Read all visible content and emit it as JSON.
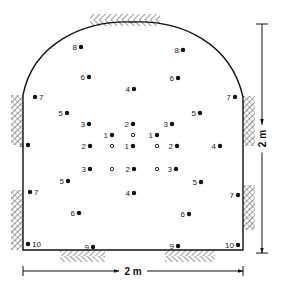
{
  "diagram": {
    "title": "",
    "colors": {
      "ink": "#111111",
      "background": "#ffffff",
      "hatch": "#222222"
    },
    "profile": {
      "left_wall_x": 23,
      "right_wall_x": 243,
      "floor_y": 250,
      "left_spring_y": 95,
      "right_spring_y": 97,
      "crown_y": 22,
      "crown_x": 133
    },
    "dimensions": {
      "width": {
        "label": "2 m",
        "x1": 23,
        "x2": 243,
        "y": 271
      },
      "height": {
        "label": "2 m",
        "x": 262,
        "y1": 24,
        "y2": 253
      }
    },
    "legend": {
      "filled_circle": "charged hole (number = firing sequence)",
      "open_circle": "empty relief hole"
    },
    "holes": [
      {
        "n": "8",
        "x": 81,
        "y": 47,
        "type": "charged",
        "label_side": "left"
      },
      {
        "n": "8",
        "x": 183,
        "y": 50,
        "type": "charged",
        "label_side": "left"
      },
      {
        "n": "6",
        "x": 89,
        "y": 77,
        "type": "charged",
        "label_side": "left"
      },
      {
        "n": "6",
        "x": 178,
        "y": 78,
        "type": "charged",
        "label_side": "left"
      },
      {
        "n": "4",
        "x": 134,
        "y": 89,
        "type": "charged",
        "label_side": "left"
      },
      {
        "n": "7",
        "x": 35,
        "y": 97,
        "type": "charged",
        "label_side": "right"
      },
      {
        "n": "7",
        "x": 235,
        "y": 97,
        "type": "charged",
        "label_side": "left"
      },
      {
        "n": "5",
        "x": 67,
        "y": 113,
        "type": "charged",
        "label_side": "left"
      },
      {
        "n": "5",
        "x": 200,
        "y": 113,
        "type": "charged",
        "label_side": "left"
      },
      {
        "n": "3",
        "x": 89,
        "y": 124,
        "type": "charged",
        "label_side": "left"
      },
      {
        "n": "2",
        "x": 133,
        "y": 124,
        "type": "charged",
        "label_side": "left"
      },
      {
        "n": "3",
        "x": 172,
        "y": 124,
        "type": "charged",
        "label_side": "left"
      },
      {
        "n": "1",
        "x": 112,
        "y": 135,
        "type": "charged",
        "label_side": "left"
      },
      {
        "n": "",
        "x": 133,
        "y": 135,
        "type": "empty",
        "label_side": "none"
      },
      {
        "n": "1",
        "x": 157,
        "y": 135,
        "type": "charged",
        "label_side": "left"
      },
      {
        "n": "4",
        "x": 28,
        "y": 145,
        "type": "charged",
        "label_side": "left"
      },
      {
        "n": "2",
        "x": 90,
        "y": 146,
        "type": "charged",
        "label_side": "left"
      },
      {
        "n": "",
        "x": 112,
        "y": 146,
        "type": "empty",
        "label_side": "none"
      },
      {
        "n": "1",
        "x": 133,
        "y": 146,
        "type": "charged",
        "label_side": "left"
      },
      {
        "n": "",
        "x": 157,
        "y": 146,
        "type": "empty",
        "label_side": "none"
      },
      {
        "n": "2",
        "x": 177,
        "y": 146,
        "type": "charged",
        "label_side": "left"
      },
      {
        "n": "4",
        "x": 220,
        "y": 146,
        "type": "charged",
        "label_side": "left"
      },
      {
        "n": "3",
        "x": 90,
        "y": 169,
        "type": "charged",
        "label_side": "left"
      },
      {
        "n": "",
        "x": 112,
        "y": 169,
        "type": "empty",
        "label_side": "none"
      },
      {
        "n": "2",
        "x": 134,
        "y": 169,
        "type": "charged",
        "label_side": "left"
      },
      {
        "n": "",
        "x": 157,
        "y": 169,
        "type": "empty",
        "label_side": "none"
      },
      {
        "n": "3",
        "x": 176,
        "y": 169,
        "type": "charged",
        "label_side": "left"
      },
      {
        "n": "5",
        "x": 68,
        "y": 181,
        "type": "charged",
        "label_side": "left"
      },
      {
        "n": "5",
        "x": 201,
        "y": 182,
        "type": "charged",
        "label_side": "left"
      },
      {
        "n": "7",
        "x": 30,
        "y": 192,
        "type": "charged",
        "label_side": "right"
      },
      {
        "n": "4",
        "x": 134,
        "y": 193,
        "type": "charged",
        "label_side": "left"
      },
      {
        "n": "7",
        "x": 238,
        "y": 195,
        "type": "charged",
        "label_side": "left"
      },
      {
        "n": "6",
        "x": 79,
        "y": 213,
        "type": "charged",
        "label_side": "left"
      },
      {
        "n": "6",
        "x": 189,
        "y": 214,
        "type": "charged",
        "label_side": "left"
      },
      {
        "n": "10",
        "x": 28,
        "y": 244,
        "type": "charged",
        "label_side": "right"
      },
      {
        "n": "9",
        "x": 93,
        "y": 247,
        "type": "charged",
        "label_side": "left"
      },
      {
        "n": "9",
        "x": 178,
        "y": 246,
        "type": "charged",
        "label_side": "left"
      },
      {
        "n": "10",
        "x": 238,
        "y": 245,
        "type": "charged",
        "label_side": "left"
      }
    ],
    "rock_hatching": [
      {
        "name": "crown-hatch",
        "x": 90,
        "y": 14,
        "w": 70,
        "h": 12
      },
      {
        "name": "left-wall-hatch",
        "x": 11,
        "y": 95,
        "w": 12,
        "h": 50
      },
      {
        "name": "left-lower-hatch",
        "x": 11,
        "y": 190,
        "w": 12,
        "h": 60
      },
      {
        "name": "right-wall-hatch",
        "x": 243,
        "y": 96,
        "w": 12,
        "h": 50
      },
      {
        "name": "right-lower-hatch",
        "x": 243,
        "y": 185,
        "w": 12,
        "h": 45
      },
      {
        "name": "floor-left-hatch",
        "x": 60,
        "y": 250,
        "w": 45,
        "h": 12
      },
      {
        "name": "floor-right-hatch",
        "x": 165,
        "y": 250,
        "w": 50,
        "h": 12
      }
    ]
  }
}
